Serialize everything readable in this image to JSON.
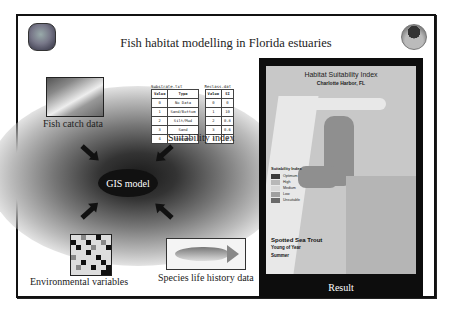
{
  "slide": {
    "title": "Fish habitat modelling in Florida estuaries",
    "logos": {
      "left": "agency-seal-icon",
      "right": "noaa-logo-icon"
    }
  },
  "inputs": {
    "fish_catch": {
      "label": "Fish catch data",
      "icon": "photo-icon"
    },
    "suitability": {
      "label": "Suitability index",
      "tables": [
        {
          "caption": "Substrate.txt",
          "headers": [
            "Value",
            "Type"
          ],
          "rows": [
            [
              "0",
              "No Data"
            ],
            [
              "1",
              "Sand/Bottom"
            ],
            [
              "2",
              "Silt/Mud"
            ],
            [
              "3",
              "Sand"
            ],
            [
              "4",
              "Seagrass"
            ]
          ]
        },
        {
          "caption": "Reclass.dat",
          "headers": [
            "Value",
            "SI"
          ],
          "rows": [
            [
              "0",
              "0"
            ],
            [
              "1",
              "10"
            ],
            [
              "2",
              "0.8"
            ],
            [
              "3",
              "0.6"
            ],
            [
              "4",
              "8"
            ]
          ]
        }
      ]
    },
    "environmental": {
      "label": "Environmental variables",
      "icon": "grid-icon"
    },
    "species": {
      "label": "Species life history data",
      "icon": "fish-icon"
    }
  },
  "model": {
    "label": "GIS model"
  },
  "result": {
    "caption": "Result",
    "map": {
      "title": "Habitat Suitability Index",
      "subtitle": "Charlotte Harbor, FL",
      "legend_title": "Suitability Index",
      "legend": [
        {
          "label": "Optimum",
          "color": "#3a3a3a"
        },
        {
          "label": "High",
          "color": "#b8b8b8"
        },
        {
          "label": "Medium",
          "color": "#d8d8d8"
        },
        {
          "label": "Low",
          "color": "#a0a0a0"
        },
        {
          "label": "Unsuitable",
          "color": "#6a6a6a"
        }
      ],
      "species": [
        "Spotted Sea Trout",
        "Young of Year",
        "Summer"
      ]
    }
  }
}
